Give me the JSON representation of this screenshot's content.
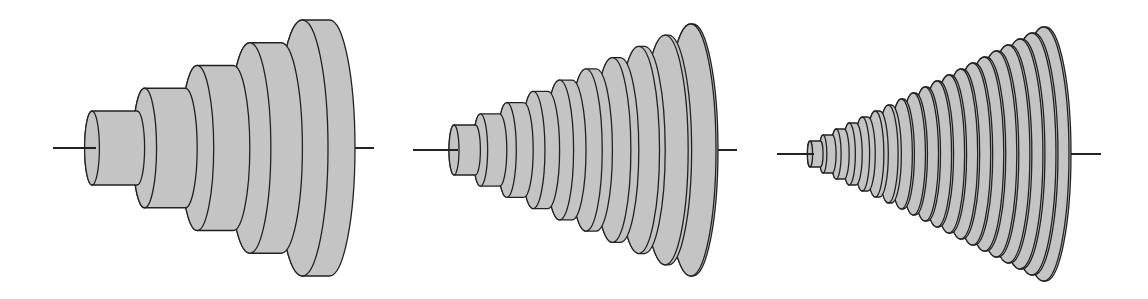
{
  "figure": {
    "fill_color": "#c4c4c4",
    "stroke_color": "#222222",
    "background": "#ffffff",
    "panels": [
      {
        "name": "panel-5-slices",
        "slices": 5,
        "axis_left_x": 53,
        "axis_right_x": 374,
        "axis_y": 148,
        "start_x": 92,
        "end_x": 355,
        "min_half_height": 37,
        "max_half_height": 128
      },
      {
        "name": "panel-10-slices",
        "slices": 10,
        "axis_left_x": 413,
        "axis_right_x": 737,
        "axis_y": 150,
        "start_x": 454,
        "end_x": 718,
        "min_half_height": 25,
        "max_half_height": 126
      },
      {
        "name": "panel-20-slices",
        "slices": 20,
        "axis_left_x": 777,
        "axis_right_x": 1101,
        "axis_y": 154,
        "start_x": 810,
        "end_x": 1071,
        "min_half_height": 13,
        "max_half_height": 127
      }
    ]
  }
}
